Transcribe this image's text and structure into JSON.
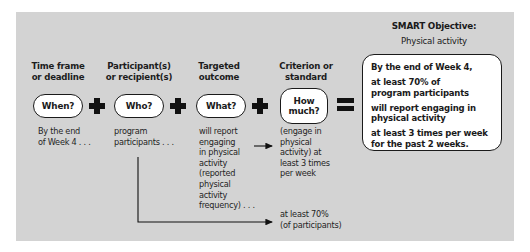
{
  "title": {
    "smart_objective": "SMART Objective:",
    "topic": "Physical activity"
  },
  "columns": [
    {
      "heading": [
        "Time frame",
        "or deadline"
      ],
      "question": "When?",
      "description": [
        "By the end",
        "of Week 4 . . ."
      ]
    },
    {
      "heading": [
        "Participant(s)",
        "or recipient(s)"
      ],
      "question": "Who?",
      "description": [
        "program",
        "participants . . ."
      ]
    },
    {
      "heading": [
        "Targeted",
        "outcome"
      ],
      "question": "What?",
      "description": [
        "will report",
        "engaging",
        "in physical",
        "activity",
        "(reported",
        "physical",
        "activity",
        "frequency) . . ."
      ]
    },
    {
      "heading": [
        "Criterion or",
        "standard"
      ],
      "question": [
        "How",
        "much?"
      ],
      "description": [
        "(engage in",
        "physical",
        "activity) at",
        "least 3 times",
        "per week"
      ]
    }
  ],
  "operators": {
    "plus": "plus-icon",
    "equals": "equals-icon"
  },
  "result": {
    "lines": [
      [
        "By the end of Week 4,"
      ],
      [
        "at least 70% of",
        "program participants"
      ],
      [
        "will report engaging in",
        "physical activity"
      ],
      [
        "at least 3 times per week",
        "for the past 2 weeks."
      ]
    ]
  },
  "participant_criterion": [
    "at least 70%",
    "(of participants)"
  ]
}
